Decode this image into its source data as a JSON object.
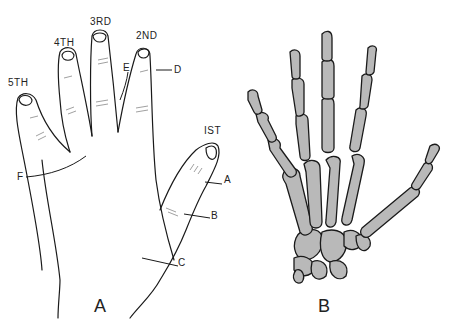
{
  "figure": {
    "panels": [
      {
        "id": "A",
        "label": "A",
        "description": "Outline of the left hand, palm view, fingers labelled"
      },
      {
        "id": "B",
        "label": "B",
        "description": "Skeleton of the hand"
      }
    ],
    "finger_labels": {
      "first": "IST",
      "second": "2ND",
      "third": "3RD",
      "fourth": "4TH",
      "fifth": "5TH"
    },
    "point_labels": {
      "a": "A",
      "b": "B",
      "c": "C",
      "d": "D",
      "e": "E",
      "f": "F"
    },
    "colors": {
      "line": "#1a1a1a",
      "bone_fill": "#b9b9b9",
      "background": "#ffffff"
    }
  }
}
